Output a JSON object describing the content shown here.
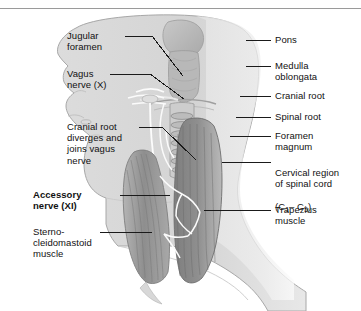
{
  "figure": {
    "background_color": "#ffffff",
    "rule_color": "#9a9a9a",
    "ink_color": "#111111",
    "art": {
      "style": "grayscale medical illustration",
      "head_fill": "#d9d9d9",
      "neck_fill": "#e3e3e3",
      "brainstem_fill": "#bdbdbd",
      "scm_fill": "#9c9c9c",
      "trapezius_fill": "#8a8a8a",
      "cord_fill": "#cfcfcf",
      "nerve_stroke": "#ffffff",
      "outline": "#8f8f8f"
    }
  },
  "labels_left": [
    {
      "id": "jugular-foramen",
      "text": "Jugular\nforamen"
    },
    {
      "id": "vagus-nerve",
      "text": "Vagus\nnerve (X)"
    },
    {
      "id": "cranial-root-diverges",
      "text": "Cranial root\ndiverges and\njoins vagus\nnerve"
    },
    {
      "id": "accessory-nerve",
      "text": "Accessory\nnerve (XI)",
      "bold": true
    },
    {
      "id": "sternocleidomastoid",
      "text": "Sterno-\ncleidomastoid\nmuscle"
    }
  ],
  "labels_right": [
    {
      "id": "pons",
      "text": "Pons"
    },
    {
      "id": "medulla-oblongata",
      "text": "Medulla\noblongata"
    },
    {
      "id": "cranial-root",
      "text": "Cranial root"
    },
    {
      "id": "spinal-root",
      "text": "Spinal root"
    },
    {
      "id": "foramen-magnum",
      "text": "Foramen\nmagnum"
    },
    {
      "id": "cervical-region",
      "text": "Cervical region\nof spinal cord",
      "suffix_prefix": "(C",
      "sub1": "1",
      "dash": "– C",
      "sub2": "5",
      "suffix_close": ")"
    },
    {
      "id": "trapezius-muscle",
      "text": "Trapezius\nmuscle"
    }
  ]
}
